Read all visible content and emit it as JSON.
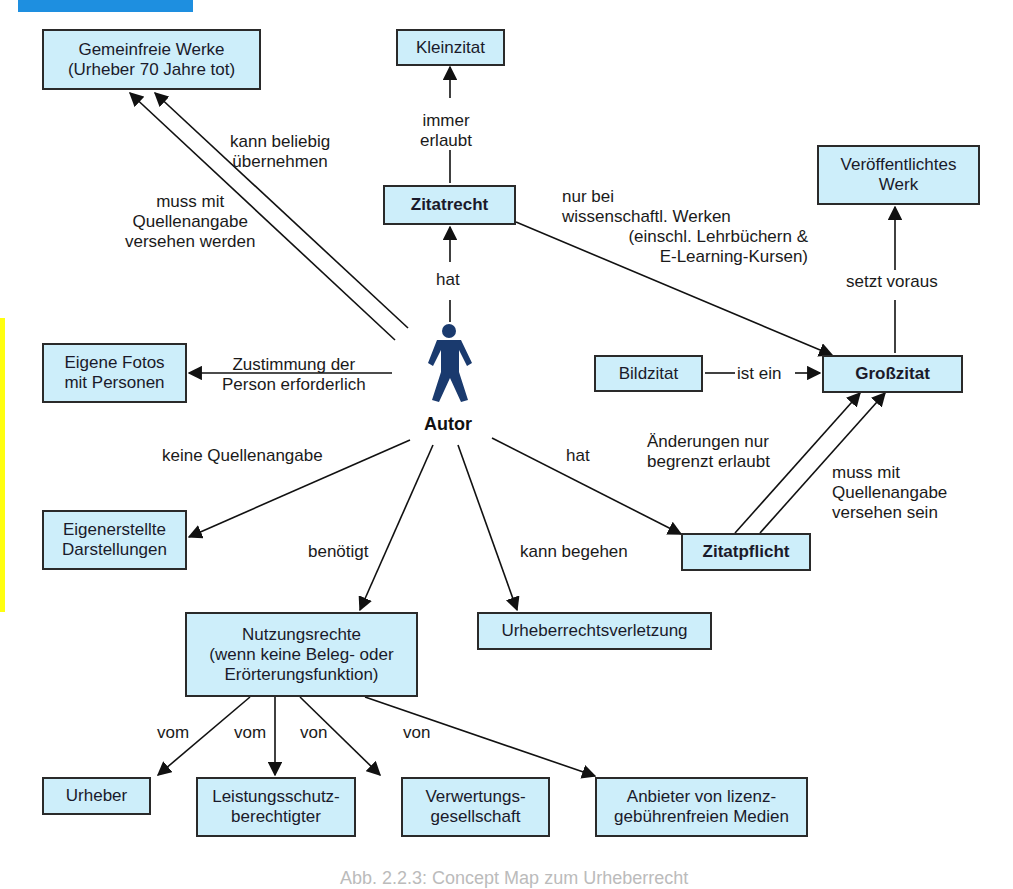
{
  "decorations": {
    "top_bar_color": "#1e8fe0",
    "side_bar_color": "#ffff10",
    "node_fill": "#cdeefa",
    "node_border": "#2a2a2a",
    "person_icon_color": "#1a3a6e"
  },
  "center": {
    "icon": "person-icon",
    "label": "Autor"
  },
  "nodes": {
    "gemeinfreie": "Gemeinfreie Werke\n(Urheber 70 Jahre tot)",
    "kleinzitat": "Kleinzitat",
    "zitatrecht": "Zitatrecht",
    "veroeffentlicht": "Veröffentlichtes\nWerk",
    "eigene_fotos": "Eigene Fotos\nmit Personen",
    "bildzitat": "Bildzitat",
    "grosszitat": "Großzitat",
    "eigenerstellte": "Eigenerstellte\nDarstellungen",
    "zitatpflicht": "Zitatpflicht",
    "nutzungsrechte": "Nutzungsrechte\n(wenn keine Beleg- oder\nErörterungsfunktion)",
    "urheberrechtsverletzung": "Urheberrechtsverletzung",
    "urheber": "Urheber",
    "leistungsschutz": "Leistungsschutz-\nberechtigter",
    "verwertung": "Verwertungs-\ngesellschaft",
    "anbieter": "Anbieter von lizenz-\ngebührenfreien Medien"
  },
  "edges": {
    "kann_beliebig": "kann beliebig\nübernehmen",
    "muss_quellen_werden": "muss mit\nQuellenangabe\nversehen werden",
    "immer_erlaubt": "immer\nerlaubt",
    "hat_zitatrecht": "hat",
    "nur_bei": "nur bei\nwissenschaftl. Werken",
    "einschl": "(einschl. Lehrbüchern &\nE-Learning-Kursen)",
    "setzt_voraus": "setzt voraus",
    "zustimmung": "Zustimmung der\nPerson erforderlich",
    "ist_ein": "ist ein",
    "keine_quellen": "keine Quellenangabe",
    "hat_zitatpflicht": "hat",
    "aenderungen": "Änderungen nur\nbegrenzt erlaubt",
    "muss_quellen_sein": "muss mit\nQuellenangabe\nversehen sein",
    "benoetigt": "benötigt",
    "kann_begehen": "kann begehen",
    "vom1": "vom",
    "vom2": "vom",
    "von1": "von",
    "von2": "von"
  },
  "caption": "Abb. 2.2.3: Concept Map zum Urheberrecht"
}
